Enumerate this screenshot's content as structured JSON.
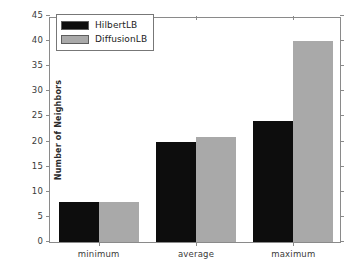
{
  "chart_data": {
    "type": "bar",
    "title": "",
    "xlabel": "",
    "ylabel": "Number of Neighbors",
    "categories": [
      "minimum",
      "average",
      "maximum"
    ],
    "series": [
      {
        "name": "HilbertLB",
        "color": "#0d0d0d",
        "values": [
          8,
          20,
          24
        ]
      },
      {
        "name": "DiffusionLB",
        "color": "#a9a9a9",
        "values": [
          8,
          21,
          40
        ]
      }
    ],
    "ylim": [
      0,
      45
    ],
    "yticks": [
      0,
      5,
      10,
      15,
      20,
      25,
      30,
      35,
      40,
      45
    ],
    "ytick_labels": [
      "0",
      "5",
      "10",
      "15",
      "20",
      "25",
      "30",
      "35",
      "40",
      "45"
    ],
    "grid": false,
    "legend_position": "upper left"
  }
}
